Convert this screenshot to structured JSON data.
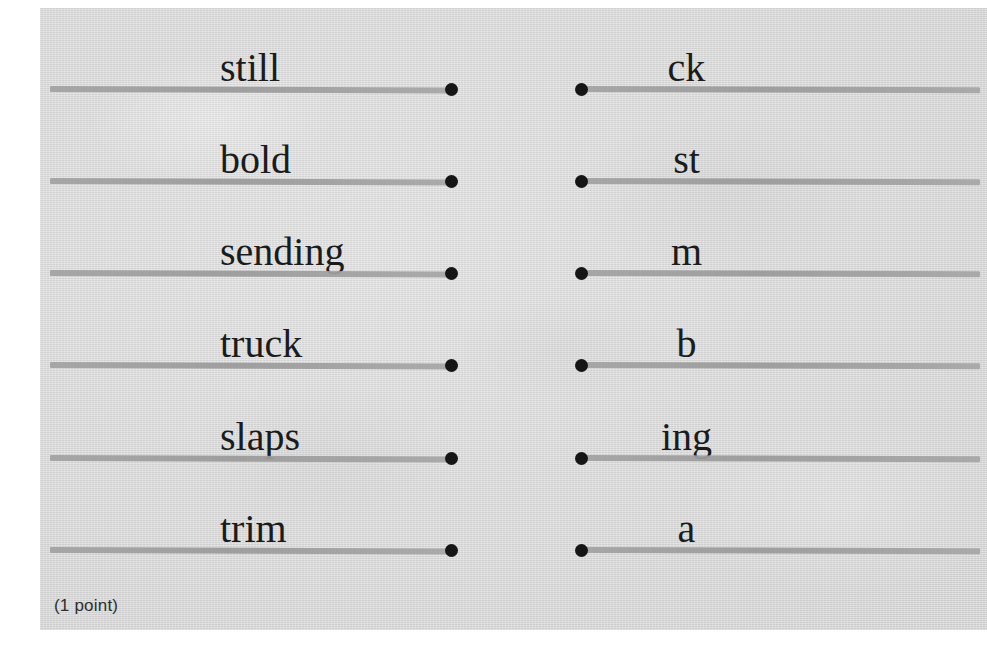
{
  "page": {
    "background_color": "#d6d6d6",
    "rule_color": "#9e9e9e",
    "dot_color": "#151515",
    "text_color": "#1b1b1b"
  },
  "footer": {
    "points_note": "(1 point)"
  },
  "exercise": {
    "left_column": [
      {
        "word": "still"
      },
      {
        "word": "bold"
      },
      {
        "word": "sending"
      },
      {
        "word": "truck"
      },
      {
        "word": "slaps"
      },
      {
        "word": "trim"
      }
    ],
    "right_column": [
      {
        "word": "ck"
      },
      {
        "word": "st"
      },
      {
        "word": "m"
      },
      {
        "word": "b"
      },
      {
        "word": "ing"
      },
      {
        "word": "a"
      }
    ]
  }
}
